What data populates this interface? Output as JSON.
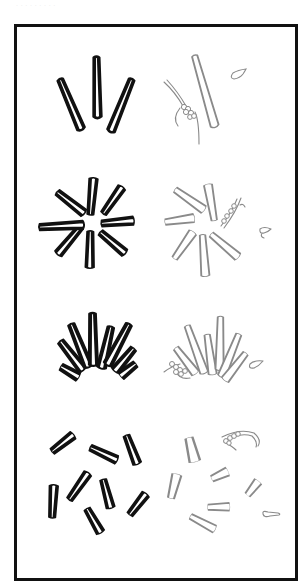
{
  "caption": "· · · · · · · · ·",
  "figure": {
    "frame": {
      "stroke": "#111111"
    },
    "colors": {
      "dark_rods": "#111111",
      "light_rods": "#8a8a8a",
      "background": "#ffffff"
    },
    "panels": [
      {
        "id": "row1-left",
        "style": "dark",
        "arrangement": "fan of 3 rods"
      },
      {
        "id": "row1-right",
        "style": "light",
        "arrangement": "single rod with beaded cluster and small curl"
      },
      {
        "id": "row2-left",
        "style": "dark",
        "arrangement": "radial star of 8 rods"
      },
      {
        "id": "row2-right",
        "style": "light",
        "arrangement": "radial star of 7 rods with beaded strand and curl"
      },
      {
        "id": "row3-left",
        "style": "dark",
        "arrangement": "semicircular fan of 8 rods"
      },
      {
        "id": "row3-right",
        "style": "light",
        "arrangement": "semicircular fan of 6 rods with beaded cluster and curl"
      },
      {
        "id": "row4-left",
        "style": "dark",
        "arrangement": "scattered 8 rods"
      },
      {
        "id": "row4-right",
        "style": "light",
        "arrangement": "scattered 7 rods with beaded strand and loop"
      }
    ]
  }
}
